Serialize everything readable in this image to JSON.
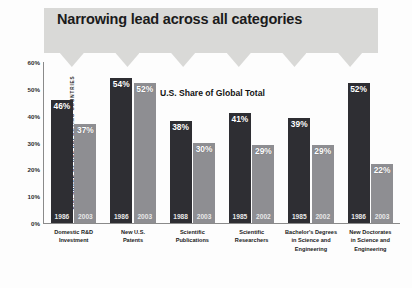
{
  "banner": {
    "title": "Narrowing lead across all categories"
  },
  "chart_data": {
    "type": "bar",
    "title": "U.S. Share of Global Total",
    "xlabel": "",
    "ylabel": "U.S. SHARE OF ALL REPORTING COUNTRIES",
    "ylim": [
      0,
      60
    ],
    "ytick_labels": [
      "60%",
      "50%",
      "40%",
      "30%",
      "20%",
      "10%",
      "0%"
    ],
    "ytick_values": [
      60,
      50,
      40,
      30,
      20,
      10,
      0
    ],
    "grid": false,
    "legend": "none",
    "categories": [
      "Domestic R&D Investment",
      "New U.S. Patents",
      "Scientific Publications",
      "Scientific Researchers",
      "Bachelor's Degrees in Science and Engineering",
      "New Doctorates in Science and Engineering"
    ],
    "groups": [
      {
        "category": "Domestic R&D Investment",
        "category_lines": [
          "Domestic R&D",
          "Investment"
        ],
        "bars": [
          {
            "year": "1986",
            "value": 46,
            "label": "46%",
            "shade": "dark"
          },
          {
            "year": "2003",
            "value": 37,
            "label": "37%",
            "shade": "light"
          }
        ]
      },
      {
        "category": "New U.S. Patents",
        "category_lines": [
          "New U.S.",
          "Patents"
        ],
        "bars": [
          {
            "year": "1986",
            "value": 54,
            "label": "54%",
            "shade": "dark"
          },
          {
            "year": "2003",
            "value": 52,
            "label": "52%",
            "shade": "light"
          }
        ]
      },
      {
        "category": "Scientific Publications",
        "category_lines": [
          "Scientific",
          "Publications"
        ],
        "bars": [
          {
            "year": "1988",
            "value": 38,
            "label": "38%",
            "shade": "dark"
          },
          {
            "year": "2003",
            "value": 30,
            "label": "30%",
            "shade": "light"
          }
        ]
      },
      {
        "category": "Scientific Researchers",
        "category_lines": [
          "Scientific",
          "Researchers"
        ],
        "bars": [
          {
            "year": "1985",
            "value": 41,
            "label": "41%",
            "shade": "dark"
          },
          {
            "year": "2002",
            "value": 29,
            "label": "29%",
            "shade": "light"
          }
        ]
      },
      {
        "category": "Bachelor's Degrees in Science and Engineering",
        "category_lines": [
          "Bachelor's Degrees",
          "in Science and",
          "Engineering"
        ],
        "bars": [
          {
            "year": "1985",
            "value": 39,
            "label": "39%",
            "shade": "dark"
          },
          {
            "year": "2002",
            "value": 29,
            "label": "29%",
            "shade": "light"
          }
        ]
      },
      {
        "category": "New Doctorates in Science and Engineering",
        "category_lines": [
          "New Doctorates",
          "in Science and",
          "Engineering"
        ],
        "bars": [
          {
            "year": "1986",
            "value": 52,
            "label": "52%",
            "shade": "dark"
          },
          {
            "year": "2003",
            "value": 22,
            "label": "22%",
            "shade": "light"
          }
        ]
      }
    ],
    "colors": {
      "bar_dark": "#2e2e33",
      "bar_light": "#8e8e92",
      "banner": "#d9d9d7",
      "axis": "#8a8a8a",
      "text": "#1b1b1b"
    }
  }
}
